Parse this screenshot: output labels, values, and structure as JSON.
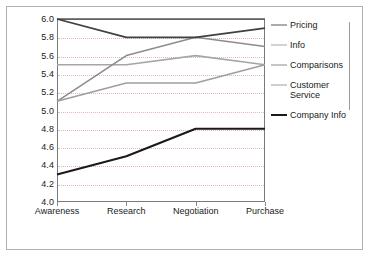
{
  "chart_data": {
    "type": "line",
    "title": "",
    "xlabel": "",
    "ylabel": "",
    "categories": [
      "Awareness",
      "Research",
      "Negotiation",
      "Purchase"
    ],
    "ylim": [
      4.0,
      6.0
    ],
    "ytick_step": 0.2,
    "ytick_labels": [
      "6.0",
      "5.8",
      "5.6",
      "5.4",
      "5.2",
      "5.0",
      "4.8",
      "4.6",
      "4.4",
      "4.2",
      "4.0"
    ],
    "ytick_values": [
      6.0,
      5.8,
      5.6,
      5.4,
      5.2,
      5.0,
      4.8,
      4.6,
      4.4,
      4.2,
      4.0
    ],
    "grid": true,
    "grid_axis": "y",
    "grid_style": "dotted",
    "grid_color": "#e3b8b8",
    "legend_position": "right",
    "series": [
      {
        "name": "Pricing",
        "values": [
          6.0,
          6.0,
          6.0,
          6.0
        ],
        "color": "#595959",
        "width": 1.6
      },
      {
        "name": "Info",
        "values": [
          5.5,
          5.5,
          5.6,
          5.5
        ],
        "color": "#a6a6a6",
        "width": 1.6
      },
      {
        "name": "Comparisons",
        "values": [
          5.1,
          5.6,
          5.8,
          5.7
        ],
        "color": "#8c8c8c",
        "width": 1.6
      },
      {
        "name": "Customer Service",
        "values": [
          5.1,
          5.3,
          5.3,
          5.5
        ],
        "color": "#9e9e9e",
        "width": 1.6
      },
      {
        "name": "Company Info",
        "values": [
          4.3,
          4.5,
          4.8,
          4.8
        ],
        "color": "#1a1a1a",
        "width": 2.1
      },
      {
        "name": "Company Info Upper",
        "values": [
          6.0,
          5.8,
          5.8,
          5.9
        ],
        "color": "#404040",
        "width": 1.8
      }
    ],
    "legend_entries": [
      {
        "label": "Pricing",
        "color": "#595959",
        "width": 1.8
      },
      {
        "label": "Info",
        "color": "#a6a6a6",
        "width": 1.8
      },
      {
        "label": "Comparisons",
        "color": "#8c8c8c",
        "width": 1.8
      },
      {
        "label": "Customer\nService",
        "color": "#9e9e9e",
        "width": 1.8
      },
      {
        "label": "Company Info",
        "color": "#1a1a1a",
        "width": 2.2
      }
    ]
  },
  "figure": {
    "border_color": "#b0b0b0",
    "plot_border_color": "#7a7a7a",
    "background": "#ffffff"
  }
}
